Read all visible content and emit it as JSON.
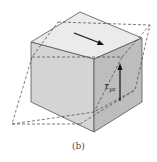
{
  "figure": {
    "caption": "(b)",
    "label_symbol": "τ",
    "label_subscript": "yz",
    "colors": {
      "top_face": "#ebebeb",
      "front_face": "#d2d2d2",
      "right_face": "#bcbcbc",
      "edge": "#555555",
      "dashed": "#444444",
      "arrow": "#111111"
    }
  }
}
